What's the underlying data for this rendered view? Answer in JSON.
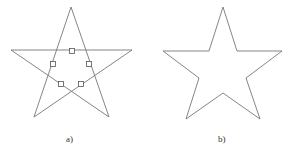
{
  "figure": {
    "panels": [
      {
        "label": "a)",
        "description": "pentagram with intersection points marked",
        "star_points": [
          [
            71,
            7
          ],
          [
            34,
            117
          ],
          [
            132,
            50
          ],
          [
            11,
            50
          ],
          [
            109,
            117
          ]
        ],
        "markers": [
          [
            72,
            51
          ],
          [
            53,
            64
          ],
          [
            89,
            64
          ],
          [
            61,
            84
          ],
          [
            81,
            84
          ]
        ]
      },
      {
        "label": "b)",
        "description": "star outline",
        "outline_points": [
          [
            223,
            7
          ],
          [
            237,
            51
          ],
          [
            282,
            51
          ],
          [
            246,
            78
          ],
          [
            260,
            119
          ],
          [
            223,
            93
          ],
          [
            186,
            119
          ],
          [
            199,
            78
          ],
          [
            163,
            51
          ],
          [
            209,
            51
          ]
        ]
      }
    ],
    "stroke_color": "#666666"
  }
}
